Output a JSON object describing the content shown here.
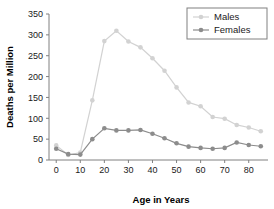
{
  "chart_data": {
    "type": "line",
    "title": "",
    "xlabel": "Age in Years",
    "ylabel": "Deaths per Million",
    "xlim": [
      -3,
      88
    ],
    "ylim": [
      0,
      350
    ],
    "grid": false,
    "legend_position": "top-right",
    "x": [
      0,
      5,
      10,
      15,
      20,
      25,
      30,
      35,
      40,
      45,
      50,
      55,
      60,
      65,
      70,
      75,
      80,
      85
    ],
    "xticks": [
      0,
      10,
      20,
      30,
      40,
      50,
      60,
      70,
      80
    ],
    "xticklabels": [
      "0",
      "10",
      "20",
      "30",
      "40",
      "50",
      "60",
      "70",
      "80"
    ],
    "yticks": [
      0,
      50,
      100,
      150,
      200,
      250,
      300,
      350
    ],
    "yticklabels": [
      "0",
      "50",
      "100",
      "150",
      "200",
      "250",
      "300",
      "350"
    ],
    "series": [
      {
        "name": "Males",
        "color": "#d2d2d2",
        "values": [
          35,
          12,
          18,
          143,
          285,
          310,
          284,
          270,
          244,
          214,
          174,
          138,
          129,
          103,
          99,
          84,
          78,
          69
        ]
      },
      {
        "name": "Females",
        "color": "#8c8c8c",
        "values": [
          27,
          14,
          13,
          50,
          76,
          71,
          71,
          72,
          63,
          52,
          40,
          32,
          29,
          27,
          29,
          42,
          36,
          33
        ]
      }
    ]
  },
  "legend": {
    "entries": [
      {
        "label": "Males"
      },
      {
        "label": "Females"
      }
    ]
  },
  "axes": {
    "x_title": "Age in Years",
    "y_title": "Deaths per Million"
  }
}
